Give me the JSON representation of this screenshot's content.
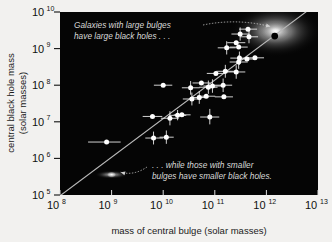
{
  "figure": {
    "background_color": "#f2f1ef",
    "plot_background_color": "#050505",
    "point_color": "#ffffff",
    "fit_line_color": "#b9b9b9",
    "annotation_color": "#d8d8d8"
  },
  "chart_data": {
    "type": "scatter",
    "title": "",
    "xlabel": "mass of central bulge (solar masses)",
    "ylabel_line1": "central black hole mass",
    "ylabel_line2": "(solar masses)",
    "xscale": "log",
    "yscale": "log",
    "xlim": [
      100000000.0,
      10000000000000.0
    ],
    "ylim": [
      100000.0,
      10000000000.0
    ],
    "grid": false,
    "legend": "none",
    "xticks": [
      {
        "value": 100000000.0,
        "mantissa": "10",
        "exponent": "8"
      },
      {
        "value": 1000000000.0,
        "mantissa": "10",
        "exponent": "9"
      },
      {
        "value": 10000000000.0,
        "mantissa": "10",
        "exponent": "10"
      },
      {
        "value": 100000000000.0,
        "mantissa": "10",
        "exponent": "11"
      },
      {
        "value": 1000000000000.0,
        "mantissa": "10",
        "exponent": "12"
      },
      {
        "value": 10000000000000.0,
        "mantissa": "10",
        "exponent": "13"
      }
    ],
    "yticks": [
      {
        "value": 100000.0,
        "mantissa": "10",
        "exponent": "5"
      },
      {
        "value": 1000000.0,
        "mantissa": "10",
        "exponent": "6"
      },
      {
        "value": 10000000.0,
        "mantissa": "10",
        "exponent": "7"
      },
      {
        "value": 100000000.0,
        "mantissa": "10",
        "exponent": "8"
      },
      {
        "value": 1000000000.0,
        "mantissa": "10",
        "exponent": "9"
      },
      {
        "value": 10000000000.0,
        "mantissa": "10",
        "exponent": "10"
      }
    ],
    "fit_line": {
      "name": "best-fit relation",
      "x_start": 105000000.0,
      "y_start": 100000.0,
      "x_end": 8000000000000.0,
      "y_end": 14000000000.0
    },
    "points": [
      {
        "x": 800000000.0,
        "y": 2800000.0,
        "xerr_lo": 450000000.0,
        "xerr_hi": 700000000.0,
        "yerr_lo": 0,
        "yerr_hi": 0
      },
      {
        "x": 6500000000.0,
        "y": 3600000.0,
        "xerr_lo": 2000000000.0,
        "xerr_hi": 3500000000.0,
        "yerr_lo": 1200000.0,
        "yerr_hi": 1800000.0
      },
      {
        "x": 11500000000.0,
        "y": 3800000.0,
        "xerr_lo": 3000000000.0,
        "xerr_hi": 4500000000.0,
        "yerr_lo": 1300000.0,
        "yerr_hi": 2000000.0
      },
      {
        "x": 6200000000.0,
        "y": 14000000.0,
        "xerr_lo": 2200000000.0,
        "xerr_hi": 3400000000.0,
        "yerr_lo": 0,
        "yerr_hi": 0
      },
      {
        "x": 19000000000.0,
        "y": 15000000.0,
        "xerr_lo": 6000000000.0,
        "xerr_hi": 9000000000.0,
        "yerr_lo": 4000000.0,
        "yerr_hi": 6000000.0
      },
      {
        "x": 23000000000.0,
        "y": 15500000.0,
        "xerr_lo": 7000000000.0,
        "xerr_hi": 11000000000.0,
        "yerr_lo": 0,
        "yerr_hi": 0
      },
      {
        "x": 13500000000.0,
        "y": 12500000.0,
        "xerr_lo": 4500000000.0,
        "xerr_hi": 6500000000.0,
        "yerr_lo": 4500000.0,
        "yerr_hi": 7000000.0
      },
      {
        "x": 80000000000.0,
        "y": 13500000.0,
        "xerr_lo": 28000000000.0,
        "xerr_hi": 42000000000.0,
        "yerr_lo": 5000000.0,
        "yerr_hi": 9000000.0
      },
      {
        "x": 36000000000.0,
        "y": 42000000.0,
        "xerr_lo": 12000000000.0,
        "xerr_hi": 18000000000.0,
        "yerr_lo": 14000000.0,
        "yerr_hi": 21000000.0
      },
      {
        "x": 50000000000.0,
        "y": 46000000.0,
        "xerr_lo": 17000000000.0,
        "xerr_hi": 25000000000.0,
        "yerr_lo": 15000000.0,
        "yerr_hi": 23000000.0
      },
      {
        "x": 68000000000.0,
        "y": 50000000.0,
        "xerr_lo": 23000000000.0,
        "xerr_hi": 34000000000.0,
        "yerr_lo": 0,
        "yerr_hi": 0
      },
      {
        "x": 150000000000.0,
        "y": 48000000.0,
        "xerr_lo": 50000000000.0,
        "xerr_hi": 75000000000.0,
        "yerr_lo": 0,
        "yerr_hi": 0
      },
      {
        "x": 10000000000.0,
        "y": 100000000.0,
        "xerr_lo": 3400000000.0,
        "xerr_hi": 5000000000.0,
        "yerr_lo": 0,
        "yerr_hi": 0
      },
      {
        "x": 34000000000.0,
        "y": 85000000.0,
        "xerr_lo": 11000000000.0,
        "xerr_hi": 17000000000.0,
        "yerr_lo": 30000000.0,
        "yerr_hi": 45000000.0
      },
      {
        "x": 55000000000.0,
        "y": 115000000.0,
        "xerr_lo": 18000000000.0,
        "xerr_hi": 27000000000.0,
        "yerr_lo": 0,
        "yerr_hi": 0
      },
      {
        "x": 75000000000.0,
        "y": 88000000.0,
        "xerr_lo": 25000000000.0,
        "xerr_hi": 38000000000.0,
        "yerr_lo": 30000000.0,
        "yerr_hi": 46000000.0
      },
      {
        "x": 90000000000.0,
        "y": 95000000.0,
        "xerr_lo": 30000000000.0,
        "xerr_hi": 45000000000.0,
        "yerr_lo": 33000000.0,
        "yerr_hi": 50000000.0
      },
      {
        "x": 145000000000.0,
        "y": 100000000.0,
        "xerr_lo": 48000000000.0,
        "xerr_hi": 72000000000.0,
        "yerr_lo": 35000000.0,
        "yerr_hi": 52000000.0
      },
      {
        "x": 105000000000.0,
        "y": 210000000.0,
        "xerr_lo": 35000000000.0,
        "xerr_hi": 52000000000.0,
        "yerr_lo": 0,
        "yerr_hi": 0
      },
      {
        "x": 160000000000.0,
        "y": 240000000.0,
        "xerr_lo": 53000000000.0,
        "xerr_hi": 80000000000.0,
        "yerr_lo": 80000000.0,
        "yerr_hi": 120000000.0
      },
      {
        "x": 260000000000.0,
        "y": 230000000.0,
        "xerr_lo": 86000000000.0,
        "xerr_hi": 130000000000.0,
        "yerr_lo": 80000000.0,
        "yerr_hi": 120000000.0
      },
      {
        "x": 300000000000.0,
        "y": 550000000.0,
        "xerr_lo": 100000000000.0,
        "xerr_hi": 150000000000.0,
        "yerr_lo": 190000000.0,
        "yerr_hi": 280000000.0
      },
      {
        "x": 420000000000.0,
        "y": 520000000.0,
        "xerr_lo": 140000000000.0,
        "xerr_hi": 210000000000.0,
        "yerr_lo": 0,
        "yerr_hi": 0
      },
      {
        "x": 600000000000.0,
        "y": 560000000.0,
        "xerr_lo": 200000000000.0,
        "xerr_hi": 300000000000.0,
        "yerr_lo": 0,
        "yerr_hi": 0
      },
      {
        "x": 290000000000.0,
        "y": 430000000.0,
        "xerr_lo": 96000000000.0,
        "xerr_hi": 145000000000.0,
        "yerr_lo": 150000000.0,
        "yerr_hi": 220000000.0
      },
      {
        "x": 170000000000.0,
        "y": 1050000000.0,
        "xerr_lo": 56000000000.0,
        "xerr_hi": 85000000000.0,
        "yerr_lo": 360000000.0,
        "yerr_hi": 540000000.0
      },
      {
        "x": 290000000000.0,
        "y": 1100000000.0,
        "xerr_lo": 96000000000.0,
        "xerr_hi": 145000000000.0,
        "yerr_lo": 0,
        "yerr_hi": 0
      },
      {
        "x": 310000000000.0,
        "y": 2500000000.0,
        "xerr_lo": 100000000000.0,
        "xerr_hi": 155000000000.0,
        "yerr_lo": 850000000.0,
        "yerr_hi": 1300000000.0
      },
      {
        "x": 460000000000.0,
        "y": 2100000000.0,
        "xerr_lo": 150000000000.0,
        "xerr_hi": 230000000000.0,
        "yerr_lo": 700000000.0,
        "yerr_hi": 1100000000.0
      },
      {
        "x": 440000000000.0,
        "y": 3400000000.0,
        "xerr_lo": 145000000000.0,
        "xerr_hi": 220000000000.0,
        "yerr_lo": 0,
        "yerr_hi": 0
      },
      {
        "x": 260000000000.0,
        "y": 1450000000.0,
        "xerr_lo": 86000000000.0,
        "xerr_hi": 130000000000.0,
        "yerr_lo": 0,
        "yerr_hi": 0
      }
    ],
    "highlight_point": {
      "name": "giant elliptical galaxy black hole",
      "x": 1450000000000.0,
      "y": 2200000000.0,
      "color": "#000000"
    },
    "galaxy_images": [
      {
        "name": "giant-elliptical-galaxy",
        "x": 1500000000000.0,
        "y": 3000000000.0
      },
      {
        "name": "small-spiral-galaxy",
        "x": 1000000000.0,
        "y": 360000.0
      }
    ],
    "annotations": [
      {
        "name": "large-bulges-annotation",
        "line1": "Galaxies with large bulges",
        "line2": "have large black holes . . .",
        "points_to_x": 1200000000000.0,
        "points_to_y": 4000000000.0
      },
      {
        "name": "small-bulges-annotation",
        "line1": ". . . while those with smaller",
        "line2": "bulges have smaller black holes.",
        "points_to_x": 1500000000.0,
        "points_to_y": 420000.0
      }
    ]
  }
}
